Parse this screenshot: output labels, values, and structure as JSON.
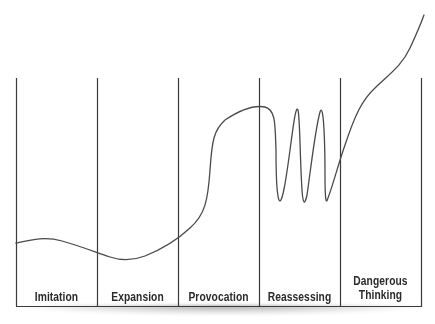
{
  "diagram": {
    "type": "staged-progression-curve",
    "stages": [
      {
        "label": "Imitation"
      },
      {
        "label": "Expansion"
      },
      {
        "label": "Provocation"
      },
      {
        "label": "Reassessing"
      },
      {
        "label": "Dangerous Thinking",
        "lines": [
          "Dangerous",
          "Thinking"
        ]
      }
    ],
    "curve_description": "Low wavy line through Imitation and Expansion, sharp rise in Provocation, oscillations in Reassessing, steep climb through Dangerous Thinking exiting top right",
    "colors": {
      "line": "#3a3a3a",
      "text": "#2a2a2a",
      "background": "#ffffff"
    }
  }
}
